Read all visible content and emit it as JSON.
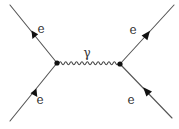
{
  "diagram": {
    "type": "feynman",
    "title": "",
    "vertices": [
      {
        "id": "v1",
        "x": 57,
        "y": 63
      },
      {
        "id": "v2",
        "x": 120,
        "y": 64
      }
    ],
    "external_lines": [
      {
        "id": "top-left",
        "from": [
          10,
          5
        ],
        "to": [
          57,
          63
        ],
        "arrow": "away-from-vertex",
        "label": "e"
      },
      {
        "id": "bottom-left",
        "from": [
          10,
          121
        ],
        "to": [
          57,
          63
        ],
        "arrow": "toward-vertex",
        "label": "e"
      },
      {
        "id": "top-right",
        "from": [
          120,
          64
        ],
        "to": [
          174,
          5
        ],
        "arrow": "away-from-vertex",
        "label": "e"
      },
      {
        "id": "bottom-right",
        "from": [
          172,
          118
        ],
        "to": [
          120,
          64
        ],
        "arrow": "toward-vertex",
        "label": "e"
      }
    ],
    "propagator": {
      "type": "photon",
      "style": "wavy",
      "from": "v1",
      "to": "v2",
      "label": "γ"
    },
    "labels": {
      "top_left": "e",
      "bottom_left": "e",
      "top_right": "e",
      "bottom_right": "e",
      "photon": "γ"
    },
    "colors": {
      "line": "#555555",
      "arrow": "#111111",
      "vertex": "#111111",
      "text": "#333333",
      "background": "#ffffff"
    }
  }
}
